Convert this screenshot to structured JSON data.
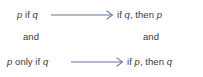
{
  "diagram": {
    "type": "logic-equivalence-mapping",
    "arrow_color": "#6277a0",
    "text_color": "#3a3a3a",
    "background": "#ffffff",
    "rows": [
      {
        "name": "first-equivalence",
        "left": "p if q",
        "left_parts": {
          "var1": "p",
          "connector": "if",
          "var2": "q"
        },
        "arrow": "rightwards-arrow",
        "right": "if q, then p",
        "right_parts": {
          "lead": "if",
          "var1": "q",
          "sep": ", then",
          "var2": "p"
        }
      },
      {
        "name": "conjunction",
        "left": "and",
        "right": "and"
      },
      {
        "name": "second-equivalence",
        "left": "p only if q",
        "left_parts": {
          "var1": "p",
          "connector": "only if",
          "var2": "q"
        },
        "arrow": "rightwards-arrow",
        "right": "if p, then q",
        "right_parts": {
          "lead": "if",
          "var1": "p",
          "sep": ", then",
          "var2": "q"
        }
      }
    ]
  }
}
